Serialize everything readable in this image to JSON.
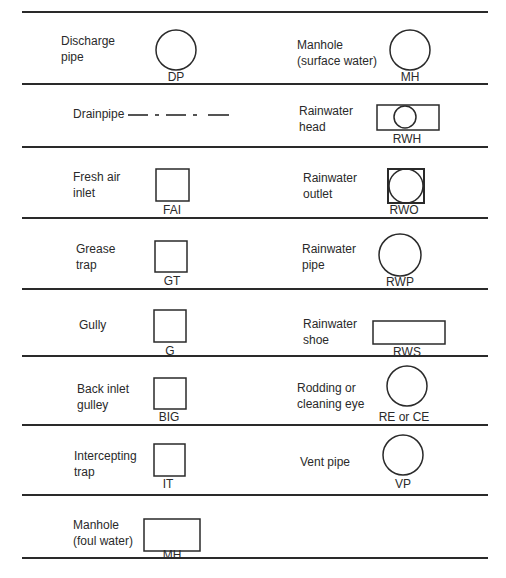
{
  "legend": {
    "rows": [
      {
        "left": {
          "name": "Discharge\npipe",
          "abbr": "DP",
          "symbol": "circle"
        },
        "right": {
          "name": "Manhole\n(surface water)",
          "abbr": "MH",
          "symbol": "circle"
        }
      },
      {
        "left": {
          "name": "Drainpipe",
          "abbr": "",
          "symbol": "dash-dot-line"
        },
        "right": {
          "name": "Rainwater\nhead",
          "abbr": "RWH",
          "symbol": "rectangle-with-circle"
        }
      },
      {
        "left": {
          "name": "Fresh air\ninlet",
          "abbr": "FAI",
          "symbol": "square"
        },
        "right": {
          "name": "Rainwater\noutlet",
          "abbr": "RWO",
          "symbol": "square-with-inscribed-circle"
        }
      },
      {
        "left": {
          "name": "Grease\ntrap",
          "abbr": "GT",
          "symbol": "square"
        },
        "right": {
          "name": "Rainwater\npipe",
          "abbr": "RWP",
          "symbol": "circle"
        }
      },
      {
        "left": {
          "name": "Gully",
          "abbr": "G",
          "symbol": "square"
        },
        "right": {
          "name": "Rainwater\nshoe",
          "abbr": "RWS",
          "symbol": "wide-rectangle"
        }
      },
      {
        "left": {
          "name": "Back inlet\ngulley",
          "abbr": "BIG",
          "symbol": "square"
        },
        "right": {
          "name": "Rodding or\ncleaning eye",
          "abbr": "RE or CE",
          "symbol": "circle"
        }
      },
      {
        "left": {
          "name": "Intercepting\ntrap",
          "abbr": "IT",
          "symbol": "square"
        },
        "right": {
          "name": "Vent pipe",
          "abbr": "VP",
          "symbol": "circle"
        }
      },
      {
        "left": {
          "name": "Manhole\n(foul water)",
          "abbr": "MH",
          "symbol": "rectangle"
        }
      }
    ]
  },
  "colors": {
    "ink": "#2a2a2a",
    "background": "#ffffff"
  }
}
